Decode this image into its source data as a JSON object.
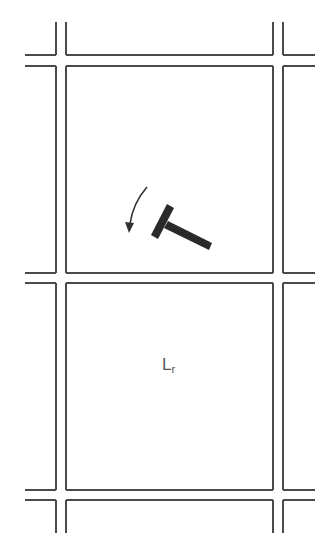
{
  "diagram": {
    "type": "street-grid-with-rotating-bar",
    "line_color": "#4a4a4a",
    "ink_color": "#2a2a2a",
    "vertical_street_pairs": [
      [
        56,
        66
      ],
      [
        273,
        283
      ]
    ],
    "horizontal_street_pairs": [
      [
        55,
        66
      ],
      [
        273,
        283
      ],
      [
        490,
        500
      ]
    ],
    "blocks": [
      {
        "name": "upper-block",
        "contains": "rotating-bar"
      },
      {
        "name": "lower-block",
        "label": "L",
        "label_subscript": "r"
      }
    ],
    "rotating_bar": {
      "shape": "T",
      "rotation_direction": "counterclockwise"
    },
    "label": {
      "main": "L",
      "subscript": "r"
    }
  }
}
